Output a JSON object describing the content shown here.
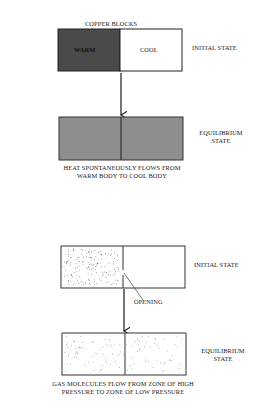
{
  "panel_heat": {
    "title": "COPPER BLOCKS",
    "initial": {
      "left_label": "WARM",
      "right_label": "COOL",
      "state_label": "INITIAL STATE",
      "left_color": "#4a4a4a",
      "right_color": "#ffffff"
    },
    "equilibrium": {
      "state_label_line1": "EQUILIBRIUM",
      "state_label_line2": "STATE",
      "color": "#8e8e8e"
    },
    "caption_line1": "HEAT SPONTANEOUSLY FLOWS FROM",
    "caption_line2": "WARM BODY TO COOL BODY"
  },
  "panel_gas": {
    "initial": {
      "state_label": "INITIAL STATE",
      "opening_label": "OPENING"
    },
    "equilibrium": {
      "state_label_line1": "EQUILIBRIUM",
      "state_label_line2": "STATE"
    },
    "caption_line1": "GAS MOLECULES FLOW FROM ZONE OF HIGH",
    "caption_line2": "PRESSURE TO ZONE OF LOW PRESSURE"
  }
}
